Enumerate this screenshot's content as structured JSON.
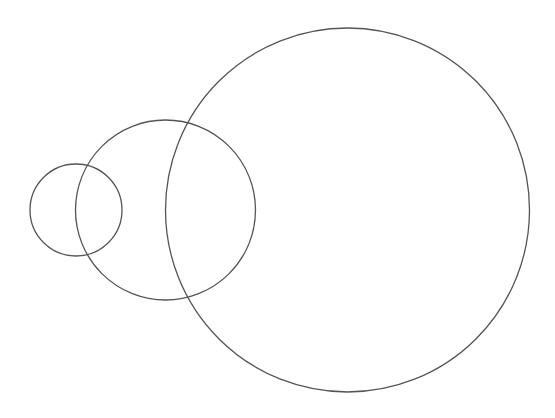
{
  "diagram": {
    "type": "circles",
    "background": "#ffffff",
    "stroke_color": "#555555",
    "stroke_width": 1.3,
    "circles": [
      {
        "name": "small-circle",
        "cx": 76,
        "cy": 210,
        "r": 46
      },
      {
        "name": "medium-circle",
        "cx": 165.5,
        "cy": 210,
        "r": 90
      },
      {
        "name": "large-circle",
        "cx": 347.5,
        "cy": 210,
        "r": 182
      }
    ]
  }
}
